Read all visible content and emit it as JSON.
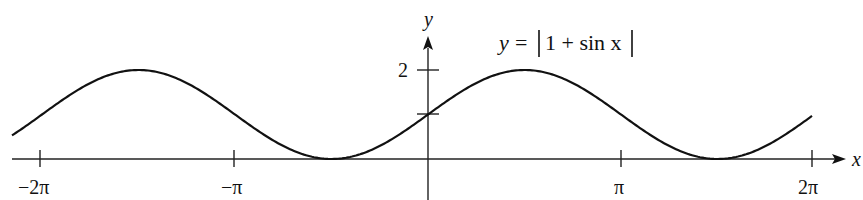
{
  "chart_data": {
    "type": "line",
    "xlabel": "x",
    "ylabel": "y",
    "x_ticks": [
      "−2π",
      "−π",
      "π",
      "2π"
    ],
    "x_tick_values": [
      -6.2832,
      -3.1416,
      3.1416,
      6.2832
    ],
    "y_ticks": [
      "2"
    ],
    "y_tick_values": [
      1,
      2
    ],
    "xlim": [
      -6.6,
      7.5
    ],
    "ylim": [
      0,
      2.6
    ],
    "grid": false,
    "series": [
      {
        "name": "y = |1 + sin x|",
        "function": "abs(1 + sin(x))",
        "x": [
          -6.2832,
          -5.4978,
          -4.7124,
          -3.927,
          -3.1416,
          -2.3562,
          -1.5708,
          -0.7854,
          0,
          0.7854,
          1.5708,
          2.3562,
          3.1416,
          3.927,
          4.7124,
          5.4978,
          6.2832
        ],
        "values": [
          1,
          1.707,
          2,
          1.707,
          1,
          0.293,
          0,
          0.293,
          1,
          1.707,
          2,
          1.707,
          1,
          0.293,
          0,
          0.293,
          1
        ]
      }
    ]
  },
  "labels": {
    "equation_lhs": "y",
    "equation_eq": "=",
    "equation_body": "1 + sin x",
    "x_axis": "x",
    "y_axis": "y",
    "y_tick_2": "2",
    "x_tick_neg2pi": "−2π",
    "x_tick_negpi": "−π",
    "x_tick_pi": "π",
    "x_tick_2pi": "2π"
  }
}
